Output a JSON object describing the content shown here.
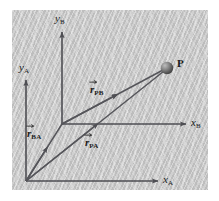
{
  "figure": {
    "panel_color": "#c9c9c9",
    "ink_color": "#55555a",
    "text_color": "#1c1c1c"
  },
  "frames": [
    {
      "id": "A",
      "origin_label": "",
      "x_axis": {
        "name": "x",
        "subscript": "A"
      },
      "y_axis": {
        "name": "y",
        "subscript": "A"
      }
    },
    {
      "id": "B",
      "origin_label": "",
      "x_axis": {
        "name": "x",
        "subscript": "B"
      },
      "y_axis": {
        "name": "y",
        "subscript": "B"
      }
    }
  ],
  "axes": {
    "y_b": {
      "name": "y",
      "subscript": "B"
    },
    "y_a": {
      "name": "y",
      "subscript": "A"
    },
    "x_b": {
      "name": "x",
      "subscript": "B"
    },
    "x_a": {
      "name": "x",
      "subscript": "A"
    }
  },
  "point": {
    "label": "P",
    "marker": "shaded-sphere"
  },
  "vectors": [
    {
      "id": "r_PB",
      "symbol": "r",
      "subscript": "PB",
      "from": "origin-B",
      "to": "point-P"
    },
    {
      "id": "r_BA",
      "symbol": "r",
      "subscript": "BA",
      "from": "origin-A",
      "to": "origin-B"
    },
    {
      "id": "r_PA",
      "symbol": "r",
      "subscript": "PA",
      "from": "origin-A",
      "to": "point-P"
    }
  ]
}
